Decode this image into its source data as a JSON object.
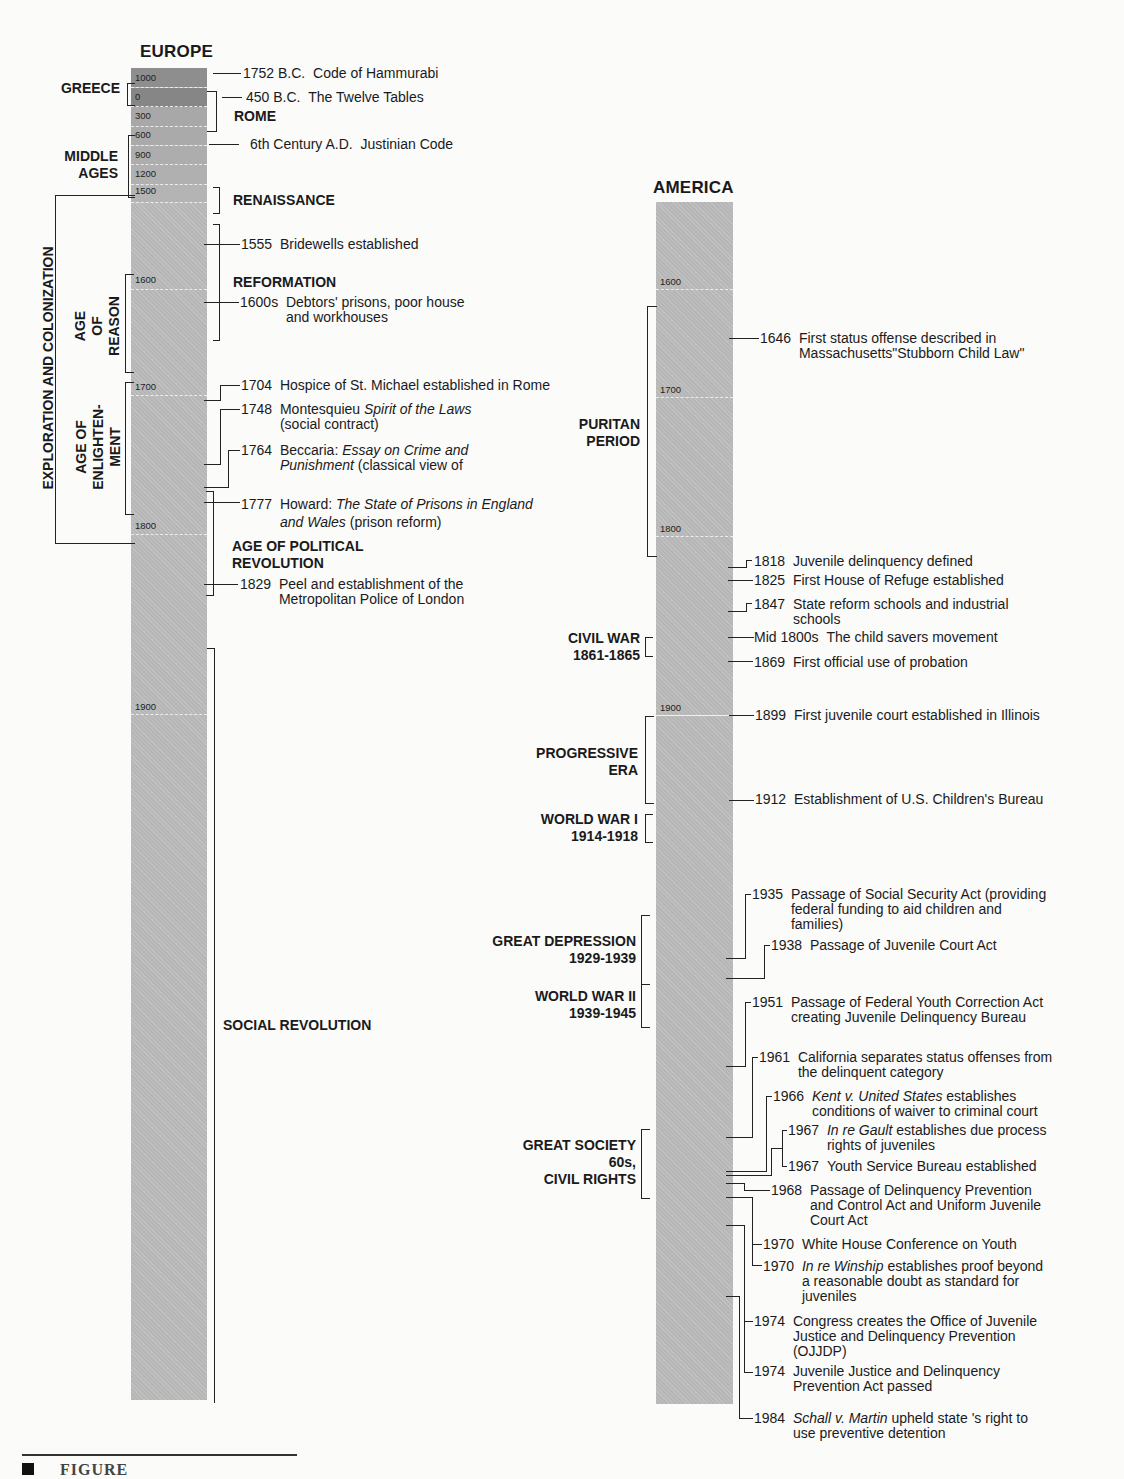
{
  "europe": {
    "title": "EUROPE",
    "ticks": [
      "1000",
      "0",
      "300",
      "600",
      "900",
      "1200",
      "1500",
      "1600",
      "1700",
      "1800",
      "1900"
    ],
    "periods": {
      "greece": "GREECE",
      "rome": "ROME",
      "middle_ages": "MIDDLE\nAGES",
      "renaissance": "RENAISSANCE",
      "reformation": "REFORMATION",
      "exploration": "EXPLORATION AND COLONIZATION",
      "age_of_reason": "AGE\nOF\nREASON",
      "enlightenment": "AGE OF\nENLIGHTEN-\nMENT",
      "political_revolution": "AGE OF POLITICAL\nREVOLUTION",
      "social_revolution": "SOCIAL REVOLUTION"
    },
    "events": [
      {
        "year": "1752 B.C.",
        "text": "Code of Hammurabi"
      },
      {
        "year": "450 B.C.",
        "text": "The Twelve Tables"
      },
      {
        "year": "6th Century A.D.",
        "text": "Justinian Code"
      },
      {
        "year": "1555",
        "text": "Bridewells established"
      },
      {
        "year": "1600s",
        "text": "Debtors' prisons, poor house\nand workhouses"
      },
      {
        "year": "1704",
        "text": "Hospice of St. Michael established in Rome"
      },
      {
        "year": "1748",
        "text_pre": "Montesquieu ",
        "text_it": "Spirit of the Laws",
        "text_post": "\n(social contract)"
      },
      {
        "year": "1764",
        "text_pre": "Beccaria:  ",
        "text_it": "Essay on Crime and\nPunishment",
        "text_post": " (classical view of"
      },
      {
        "year": "1777",
        "text_pre": "Howard:  ",
        "text_it": "The State of Prisons in England\nand Wales",
        "text_post": " (prison reform)"
      },
      {
        "year": "1829",
        "text": "Peel and establishment of the\nMetropolitan Police of London"
      }
    ]
  },
  "america": {
    "title": "AMERICA",
    "ticks": [
      "1600",
      "1700",
      "1800",
      "1900"
    ],
    "periods": {
      "puritan": "PURITAN\nPERIOD",
      "civil_war": "CIVIL WAR\n1861-1865",
      "progressive": "PROGRESSIVE\nERA",
      "ww1": "WORLD WAR I\n1914-1918",
      "depression": "GREAT DEPRESSION\n1929-1939",
      "ww2": "WORLD WAR II\n1939-1945",
      "great_society": "GREAT SOCIETY\n60s,\nCIVIL RIGHTS"
    },
    "events": [
      {
        "year": "1646",
        "text": "First status offense described in\nMassachusetts\"Stubborn Child Law\""
      },
      {
        "year": "1818",
        "text": "Juvenile delinquency defined"
      },
      {
        "year": "1825",
        "text": "First House of Refuge established"
      },
      {
        "year": "1847",
        "text": "State reform schools and industrial\nschools"
      },
      {
        "year": "Mid 1800s",
        "text": "The child savers movement"
      },
      {
        "year": "1869",
        "text": "First official use of probation"
      },
      {
        "year": "1899",
        "text": "First juvenile court established in Illinois"
      },
      {
        "year": "1912",
        "text": "Establishment of U.S. Children's Bureau"
      },
      {
        "year": "1935",
        "text": "Passage of Social Security Act (providing\nfederal funding to aid children and\nfamilies)"
      },
      {
        "year": "1938",
        "text": "Passage of Juvenile Court Act"
      },
      {
        "year": "1951",
        "text": "Passage of Federal Youth Correction Act\ncreating Juvenile Delinquency Bureau"
      },
      {
        "year": "1961",
        "text": "California separates status offenses from\nthe delinquent category"
      },
      {
        "year": "1966",
        "text_it": "Kent v. United States",
        "text_post": " establishes\nconditions of waiver to criminal court"
      },
      {
        "year": "1967",
        "text_it": "In re Gault",
        "text_post": " establishes due process\nrights of juveniles"
      },
      {
        "year": "1967",
        "text": "Youth Service Bureau established"
      },
      {
        "year": "1968",
        "text": "Passage of Delinquency Prevention\nand Control Act and Uniform Juvenile\nCourt Act"
      },
      {
        "year": "1970",
        "text": "White House Conference on Youth"
      },
      {
        "year": "1970",
        "text_it": "In re Winship",
        "text_post": " establishes proof beyond\na reasonable doubt as standard for\njuveniles"
      },
      {
        "year": "1974",
        "text": "Congress creates the Office of Juvenile\nJustice and Delinquency Prevention\n(OJJDP)"
      },
      {
        "year": "1974",
        "text": "Juvenile Justice and Delinquency\nPrevention Act passed"
      },
      {
        "year": "1984",
        "text_it": "Schall v. Martin",
        "text_post": " upheld state 's right to\nuse preventive detention"
      }
    ]
  },
  "caption": "FIGURE",
  "colors": {
    "bar": "#bcbcbc",
    "bar_dark": "#8a8a8a",
    "bar_mid": "#9e9e9e",
    "ink": "#1a1a1a"
  }
}
